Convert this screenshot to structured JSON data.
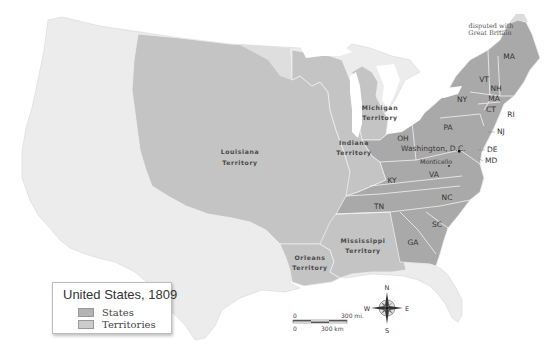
{
  "map": {
    "title": "United States, 1809",
    "colors": {
      "states": "#a9a9a9",
      "territories": "#c4c4c4",
      "other_land": "#ececec",
      "water": "#ffffff",
      "borders": "#f4f4f4"
    },
    "legend": {
      "title": "United States, 1809",
      "items": [
        {
          "label": "States",
          "color": "#b3b3b3"
        },
        {
          "label": "Territories",
          "color": "#cccccc"
        }
      ]
    },
    "territories": [
      {
        "line1": "Louisiana",
        "line2": "Territory"
      },
      {
        "line1": "Indiana",
        "line2": "Territory"
      },
      {
        "line1": "Michigan",
        "line2": "Territory"
      },
      {
        "line1": "Mississippi",
        "line2": "Territory"
      },
      {
        "line1": "Orleans",
        "line2": "Territory"
      }
    ],
    "states": [
      "MA",
      "VT",
      "NH",
      "MA",
      "CT",
      "RI",
      "NY",
      "NJ",
      "PA",
      "DE",
      "MD",
      "OH",
      "VA",
      "KY",
      "TN",
      "NC",
      "SC",
      "GA"
    ],
    "places": {
      "capital": "Washington, D.C.",
      "monticello": "Monticello"
    },
    "annotation": {
      "line1": "disputed with",
      "line2": "Great Britain"
    },
    "scale": {
      "zero_top": "0",
      "miles": "300 mi.",
      "zero_bottom": "0",
      "km": "300 km"
    },
    "compass": {
      "n": "N",
      "s": "S",
      "e": "E",
      "w": "W"
    }
  }
}
